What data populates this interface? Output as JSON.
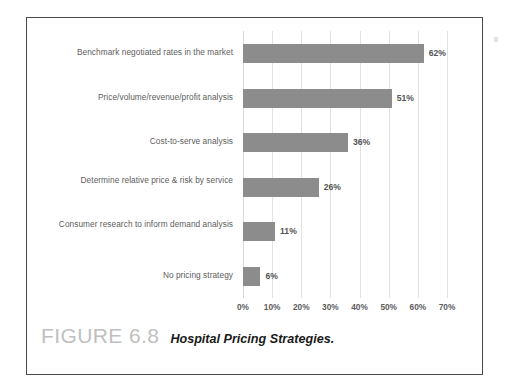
{
  "figure": {
    "number_label": "FIGURE 6.8",
    "title": "Hospital Pricing Strategies."
  },
  "colors": {
    "bar": "#8c8c8c",
    "gridline": "#e2e2e2",
    "label_text": "#5d5d5d",
    "value_text": "#555555",
    "frame_border": "#4a4a4a",
    "caption_figure": "#c0c0c0",
    "caption_title": "#1a1a1a",
    "background": "#ffffff"
  },
  "chart_data": {
    "type": "bar",
    "orientation": "horizontal",
    "title": "Hospital Pricing Strategies.",
    "xlabel": "",
    "ylabel": "",
    "xlim": [
      0,
      70
    ],
    "grid": true,
    "legend": "none",
    "categories": [
      "Benchmark negotiated rates in the market",
      "Price/volume/revenue/profit analysis",
      "Cost-to-serve analysis",
      "Determine relative price & risk by service",
      "Consumer research to inform demand analysis",
      "No pricing strategy"
    ],
    "values": [
      62,
      51,
      36,
      26,
      11,
      6
    ],
    "value_labels": [
      "62%",
      "51%",
      "36%",
      "26%",
      "11%",
      "6%"
    ],
    "xticks": [
      0,
      10,
      20,
      30,
      40,
      50,
      60,
      70
    ],
    "xtick_labels": [
      "0%",
      "10%",
      "20%",
      "30%",
      "40%",
      "50%",
      "60%",
      "70%"
    ]
  }
}
